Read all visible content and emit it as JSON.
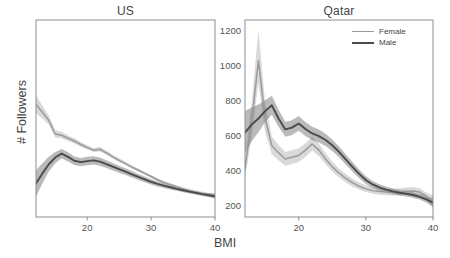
{
  "figure": {
    "xlabel": "BMI",
    "ylabel": "# Followers"
  },
  "panels": [
    {
      "key": "us",
      "title": "US"
    },
    {
      "key": "qatar",
      "title": "Qatar"
    }
  ],
  "legend": {
    "position": "top-right-qatar",
    "entries": [
      {
        "label": "Female",
        "color": "#9a9a9a"
      },
      {
        "label": "Male",
        "color": "#4a4a4a"
      }
    ]
  },
  "axes": {
    "yticks": [
      200,
      400,
      600,
      800,
      1000,
      1200
    ],
    "ylim": [
      140,
      1260
    ],
    "xticks": [
      20,
      30,
      40
    ],
    "xlim": [
      12,
      40
    ],
    "grid": false
  },
  "chart_data": {
    "type": "line",
    "title": "",
    "xlabel": "BMI",
    "ylabel": "# Followers",
    "ylim": [
      140,
      1260
    ],
    "xlim": [
      12,
      40
    ],
    "yticks": [
      200,
      400,
      600,
      800,
      1000,
      1200
    ],
    "xticks": [
      20,
      30,
      40
    ],
    "grid": false,
    "legend_position": "upper right of Qatar panel",
    "panels": [
      {
        "name": "US",
        "x": [
          12,
          13,
          14,
          15,
          16,
          17,
          18,
          19,
          20,
          21,
          22,
          23,
          24,
          25,
          26,
          27,
          28,
          29,
          30,
          31,
          32,
          33,
          34,
          35,
          36,
          37,
          38,
          39,
          40
        ],
        "series": [
          {
            "name": "Female",
            "color": "#9a9a9a",
            "values": [
              780,
              735,
              690,
              612,
              605,
              588,
              572,
              552,
              535,
              520,
              525,
              505,
              482,
              462,
              443,
              424,
              406,
              388,
              370,
              352,
              336,
              324,
              312,
              300,
              290,
              282,
              274,
              268,
              262
            ],
            "band_lower": [
              730,
              700,
              665,
              592,
              588,
              572,
              558,
              540,
              524,
              510,
              513,
              494,
              472,
              452,
              434,
              415,
              398,
              380,
              362,
              344,
              328,
              316,
              304,
              292,
              282,
              274,
              266,
              258,
              250
            ],
            "band_upper": [
              832,
              772,
              716,
              634,
              624,
              604,
              588,
              566,
              548,
              532,
              538,
              518,
              494,
              474,
              454,
              434,
              416,
              397,
              379,
              361,
              345,
              333,
              321,
              309,
              299,
              291,
              283,
              278,
              275
            ]
          },
          {
            "name": "Male",
            "color": "#4a4a4a",
            "values": [
              330,
              388,
              440,
              478,
              500,
              482,
              460,
              452,
              458,
              462,
              455,
              441,
              426,
              412,
              398,
              383,
              368,
              354,
              340,
              328,
              318,
              309,
              300,
              292,
              284,
              277,
              270,
              264,
              258
            ],
            "band_lower": [
              255,
              330,
              398,
              446,
              474,
              456,
              436,
              428,
              434,
              438,
              432,
              419,
              405,
              392,
              379,
              365,
              351,
              338,
              325,
              314,
              305,
              297,
              289,
              281,
              274,
              267,
              260,
              253,
              244
            ],
            "band_upper": [
              406,
              446,
              482,
              510,
              526,
              508,
              484,
              476,
              482,
              486,
              478,
              463,
              447,
              432,
              417,
              401,
              385,
              370,
              355,
              342,
              331,
              321,
              311,
              303,
              294,
              287,
              280,
              275,
              272
            ]
          }
        ]
      },
      {
        "name": "Qatar",
        "x": [
          12,
          13,
          14,
          15,
          16,
          17,
          18,
          19,
          20,
          21,
          22,
          23,
          24,
          25,
          26,
          27,
          28,
          29,
          30,
          31,
          32,
          33,
          34,
          35,
          36,
          37,
          38,
          39,
          40
        ],
        "series": [
          {
            "name": "Female",
            "color": "#9a9a9a",
            "values": [
              415,
              690,
              1030,
              700,
              545,
              505,
              470,
              480,
              490,
              520,
              555,
              520,
              470,
              425,
              390,
              360,
              335,
              315,
              300,
              290,
              285,
              282,
              280,
              282,
              286,
              288,
              282,
              258,
              225
            ],
            "band_lower": [
              360,
              600,
              900,
              620,
              495,
              462,
              432,
              442,
              452,
              482,
              518,
              486,
              440,
              398,
              366,
              338,
              314,
              296,
              282,
              272,
              267,
              264,
              262,
              263,
              266,
              268,
              262,
              236,
              190
            ],
            "band_upper": [
              470,
              790,
              1205,
              790,
              598,
              550,
              510,
              520,
              530,
              560,
              595,
              556,
              502,
              454,
              416,
              384,
              358,
              336,
              320,
              309,
              304,
              301,
              300,
              303,
              308,
              311,
              304,
              280,
              262
            ]
          },
          {
            "name": "Male",
            "color": "#4a4a4a",
            "values": [
              620,
              665,
              700,
              742,
              775,
              700,
              638,
              648,
              672,
              640,
              615,
              600,
              578,
              548,
              510,
              468,
              425,
              385,
              350,
              325,
              308,
              296,
              286,
              278,
              272,
              265,
              255,
              240,
              222
            ],
            "band_lower": [
              500,
              570,
              622,
              680,
              722,
              652,
              596,
              606,
              630,
              600,
              578,
              564,
              543,
              515,
              479,
              439,
              398,
              360,
              328,
              305,
              290,
              279,
              270,
              262,
              256,
              249,
              239,
              222,
              198
            ],
            "band_upper": [
              742,
              762,
              780,
              804,
              830,
              750,
              682,
              690,
              714,
              680,
              653,
              637,
              613,
              581,
              541,
              497,
              452,
              410,
              372,
              345,
              326,
              313,
              302,
              294,
              288,
              281,
              271,
              258,
              246
            ]
          }
        ]
      }
    ]
  }
}
